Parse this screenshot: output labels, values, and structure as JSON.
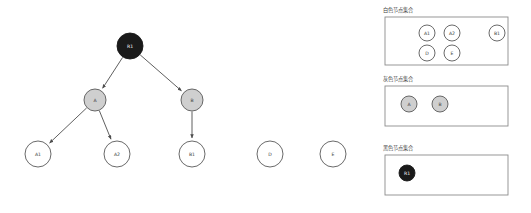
{
  "diagram": {
    "type": "tree-with-node-set-legend",
    "background_color": "#ffffff",
    "colors": {
      "white_node_fill": "#ffffff",
      "gray_node_fill": "#cfcfcf",
      "black_node_fill": "#1a1a1a",
      "node_stroke": "#595959",
      "edge_stroke": "#4d4d4d",
      "panel_border": "#8c8c8c",
      "label_text": "#3d3d3d",
      "label_text_on_dark": "#ffffff"
    },
    "tree": {
      "nodes": [
        {
          "id": "R1",
          "label": "R1",
          "color": "black",
          "cx": 130,
          "cy": 46,
          "r": 13
        },
        {
          "id": "A",
          "label": "A",
          "color": "gray",
          "cx": 95,
          "cy": 100,
          "r": 11
        },
        {
          "id": "B",
          "label": "B",
          "color": "gray",
          "cx": 192,
          "cy": 100,
          "r": 11
        },
        {
          "id": "A1",
          "label": "A1",
          "color": "white",
          "cx": 38,
          "cy": 154,
          "r": 13
        },
        {
          "id": "A2",
          "label": "A2",
          "color": "white",
          "cx": 117,
          "cy": 154,
          "r": 13
        },
        {
          "id": "B1",
          "label": "B1",
          "color": "white",
          "cx": 192,
          "cy": 154,
          "r": 13
        },
        {
          "id": "D",
          "label": "D",
          "color": "white",
          "cx": 270,
          "cy": 154,
          "r": 13
        },
        {
          "id": "E",
          "label": "E",
          "color": "white",
          "cx": 333,
          "cy": 154,
          "r": 13
        }
      ],
      "edges": [
        {
          "from": "R1",
          "to": "A"
        },
        {
          "from": "R1",
          "to": "B"
        },
        {
          "from": "A",
          "to": "A1"
        },
        {
          "from": "A",
          "to": "A2"
        },
        {
          "from": "B",
          "to": "B1"
        }
      ],
      "isolated_nodes": [
        "D",
        "E"
      ]
    },
    "legend_panels": [
      {
        "id": "white-node-set",
        "title": "白色节点集合",
        "box": {
          "x": 385,
          "y": 17,
          "width": 123,
          "height": 48
        },
        "nodes": [
          {
            "label": "A1",
            "color": "white",
            "cx": 427,
            "cy": 33,
            "r": 8
          },
          {
            "label": "A2",
            "color": "white",
            "cx": 452,
            "cy": 33,
            "r": 8
          },
          {
            "label": "B1",
            "color": "white",
            "cx": 497,
            "cy": 33,
            "r": 8
          },
          {
            "label": "D",
            "color": "white",
            "cx": 427,
            "cy": 53,
            "r": 8
          },
          {
            "label": "E",
            "color": "white",
            "cx": 452,
            "cy": 53,
            "r": 8
          }
        ]
      },
      {
        "id": "gray-node-set",
        "title": "灰色节点集合",
        "box": {
          "x": 385,
          "y": 86,
          "width": 123,
          "height": 40
        },
        "nodes": [
          {
            "label": "A",
            "color": "gray",
            "cx": 409,
            "cy": 104,
            "r": 8
          },
          {
            "label": "B",
            "color": "gray",
            "cx": 440,
            "cy": 104,
            "r": 8
          }
        ]
      },
      {
        "id": "black-node-set",
        "title": "黑色节点集合",
        "box": {
          "x": 385,
          "y": 155,
          "width": 123,
          "height": 40
        },
        "nodes": [
          {
            "label": "R1",
            "color": "black",
            "cx": 407,
            "cy": 173,
            "r": 8
          }
        ]
      }
    ]
  }
}
